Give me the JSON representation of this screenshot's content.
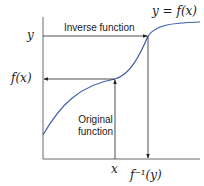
{
  "diagram": {
    "curve_label": "y = f(x)",
    "inverse_label": "Inverse function",
    "original_label_line1": "Original",
    "original_label_line2": "function",
    "y_tick_top": "y",
    "y_tick_mid": "f(x)",
    "x_tick": "x",
    "x_tick_inverse": "f⁻¹(y)",
    "colors": {
      "curve": "#3a5fa8",
      "lines": "#222222"
    }
  }
}
